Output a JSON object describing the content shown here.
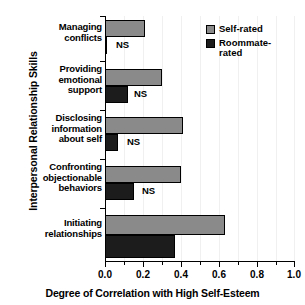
{
  "chart_data": {
    "type": "bar",
    "orientation": "horizontal",
    "title": "",
    "xlabel": "Degree of Correlation with High Self-Esteem",
    "ylabel": "Interpersonal Relationship Skills",
    "xlim": [
      0.0,
      1.0
    ],
    "xticks": [
      0.0,
      0.2,
      0.4,
      0.6,
      0.8,
      1.0
    ],
    "xticklabels": [
      "0.0",
      "0.2",
      "0.4",
      "0.6",
      "0.8",
      "1.0"
    ],
    "minor_tick_interval": 0.1,
    "grid": true,
    "grid_axis": "x",
    "legend_position": "upper right",
    "categories": [
      "Managing conflicts",
      "Providing emotional support",
      "Disclosing information about self",
      "Confronting objectionable behaviors",
      "Initiating relationships"
    ],
    "category_label_lines": [
      [
        "Managing",
        "conflicts"
      ],
      [
        "Providing",
        "emotional",
        "support"
      ],
      [
        "Disclosing",
        "information",
        "about self"
      ],
      [
        "Confronting",
        "objectionable",
        "behaviors"
      ],
      [
        "Initiating",
        "relationships"
      ]
    ],
    "series": [
      {
        "name": "Self-rated",
        "color": "#8a8a8a",
        "values": [
          0.21,
          0.3,
          0.41,
          0.4,
          0.63
        ]
      },
      {
        "name": "Roommate-rated",
        "color": "#1c1c1c",
        "values": [
          0.01,
          0.12,
          0.07,
          0.15,
          0.37
        ]
      }
    ],
    "annotations": [
      {
        "text": "NS",
        "category": "Managing conflicts",
        "series": "Roommate-rated"
      },
      {
        "text": "NS",
        "category": "Providing emotional support",
        "series": "Roommate-rated"
      },
      {
        "text": "NS",
        "category": "Disclosing information about self",
        "series": "Roommate-rated"
      },
      {
        "text": "NS",
        "category": "Confronting objectionable behaviors",
        "series": "Roommate-rated"
      }
    ]
  },
  "legend": {
    "items": [
      {
        "label": "Self-rated"
      },
      {
        "label": "Roommate-\nrated"
      }
    ]
  },
  "axes": {
    "x_title": "Degree of Correlation with High Self-Esteem",
    "y_title": "Interpersonal Relationship Skills",
    "tick_0": "0.0",
    "tick_1": "0.2",
    "tick_2": "0.4",
    "tick_3": "0.6",
    "tick_4": "0.8",
    "tick_5": "1.0"
  },
  "labels": {
    "cat0_l0": "Managing",
    "cat0_l1": "conflicts",
    "cat1_l0": "Providing",
    "cat1_l1": "emotional",
    "cat1_l2": "support",
    "cat2_l0": "Disclosing",
    "cat2_l1": "information",
    "cat2_l2": "about self",
    "cat3_l0": "Confronting",
    "cat3_l1": "objectionable",
    "cat3_l2": "behaviors",
    "cat4_l0": "Initiating",
    "cat4_l1": "relationships",
    "ns0": "NS",
    "ns1": "NS",
    "ns2": "NS",
    "ns3": "NS"
  }
}
